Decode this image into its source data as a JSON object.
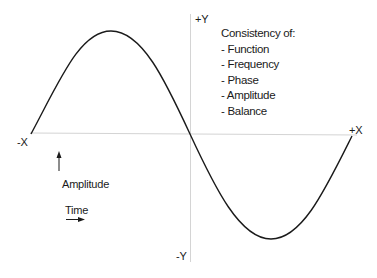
{
  "diagram": {
    "type": "sine-wave",
    "axes": {
      "pos_y": "+Y",
      "neg_y": "-Y",
      "pos_x": "+X",
      "neg_x": "-X"
    },
    "legend": {
      "title": "Consistency of:",
      "items": [
        "- Function",
        "- Frequency",
        "- Phase",
        "- Amplitude",
        "- Balance"
      ]
    },
    "key": {
      "amplitude_label": "Amplitude",
      "time_label": "Time"
    },
    "colors": {
      "curve": "#1a1a1a",
      "axis": "#d0d0d0",
      "text": "#1a1a1a"
    }
  }
}
